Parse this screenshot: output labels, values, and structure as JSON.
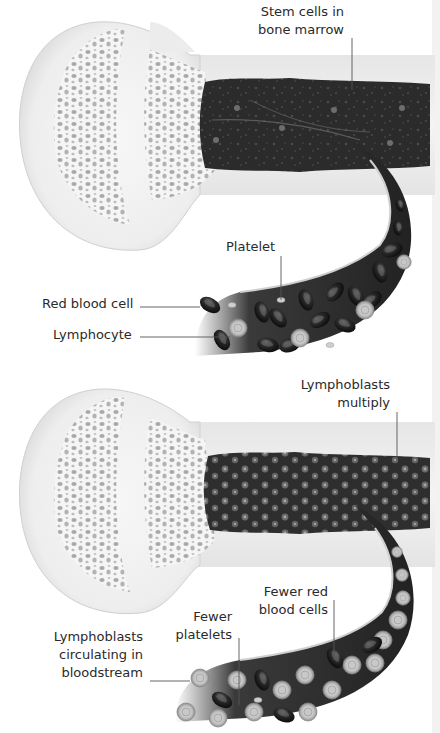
{
  "figure": {
    "panels": [
      {
        "id": "normal",
        "labels": {
          "stem_cells": [
            "Stem cells in",
            "bone marrow"
          ],
          "platelet": "Platelet",
          "red_blood_cell": "Red blood cell",
          "lymphocyte": "Lymphocyte"
        }
      },
      {
        "id": "leukemia",
        "labels": {
          "lymphoblasts_multiply": [
            "Lymphoblasts",
            "multiply"
          ],
          "fewer_rbc": [
            "Fewer red",
            "blood cells"
          ],
          "fewer_platelets": [
            "Fewer",
            "platelets"
          ],
          "lymphoblasts_circulating": [
            "Lymphoblasts",
            "circulating in",
            "bloodstream"
          ]
        }
      }
    ],
    "colors": {
      "bone": "#ececec",
      "bone_edge": "#d6d6d6",
      "marrow": "#2b2b2b",
      "label_text": "#2a2a2a",
      "leader_line": "#555555"
    }
  }
}
